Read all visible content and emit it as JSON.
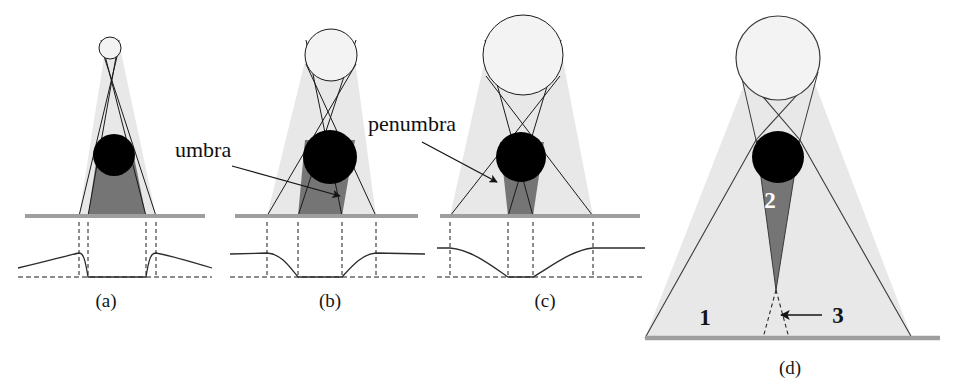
{
  "figure": {
    "background_color": "#ffffff"
  },
  "palette": {
    "umbra_fill": "#7a7a7a",
    "penumbra_fill": "#e6e6e6",
    "occluder_fill": "#000000",
    "source_fill": "#f2f2f2",
    "ground_color": "#9e9e9e",
    "outline_color": "#1a1a1a",
    "curve_color": "#2b2b2b",
    "dash_color": "#1a1a1a",
    "text_color": "#101010",
    "number_light_color": "#ffffff"
  },
  "callouts": [
    {
      "id": "umbra",
      "label": "umbra",
      "x": 175,
      "y": 157,
      "arrow_from": [
        232,
        166
      ],
      "arrow_to": [
        340,
        196
      ]
    },
    {
      "id": "penumbra",
      "label": "penumbra",
      "x": 368,
      "y": 131,
      "arrow_from": [
        422,
        142
      ],
      "arrow_to": [
        497,
        182
      ]
    }
  ],
  "panels": [
    {
      "id": "a",
      "label": "(a)",
      "label_x": 106,
      "label_y": 307,
      "source_size": "point-like (small)",
      "source": {
        "cx": 110,
        "cy": 48,
        "r": 11
      },
      "occluder": {
        "cx": 114,
        "cy": 155,
        "r": 21
      },
      "ground": {
        "x1": 25,
        "x2": 205,
        "y": 216
      },
      "umbra_band": {
        "left": 88,
        "right": 146
      },
      "penumbra_band": {
        "left": 79,
        "right": 156
      },
      "profile": {
        "baseline_y": 277,
        "plateau_y": 253,
        "outer_left": 18,
        "outer_right": 212,
        "shadow_left": 88,
        "shadow_right": 146,
        "penumbra_left": 79,
        "penumbra_right": 156,
        "description": "hard shadow: near-vertical transitions, flat dark core"
      }
    },
    {
      "id": "b",
      "label": "(b)",
      "label_x": 330,
      "label_y": 307,
      "source_size": "medium",
      "source": {
        "cx": 331,
        "cy": 55,
        "r": 26
      },
      "occluder": {
        "cx": 330,
        "cy": 157,
        "r": 27
      },
      "ground": {
        "x1": 235,
        "x2": 418,
        "y": 216
      },
      "umbra_band": {
        "left": 298,
        "right": 342
      },
      "penumbra_band": {
        "left": 267,
        "right": 376
      },
      "profile": {
        "baseline_y": 277,
        "plateau_y": 253,
        "outer_left": 230,
        "outer_right": 425,
        "shadow_left": 298,
        "shadow_right": 342,
        "penumbra_left": 267,
        "penumbra_right": 376,
        "description": "soft shadow: gradual S-curve transitions, flat dark core"
      }
    },
    {
      "id": "c",
      "label": "(c)",
      "label_x": 545,
      "label_y": 307,
      "source_size": "large",
      "source": {
        "cx": 523,
        "cy": 55,
        "r": 40
      },
      "occluder": {
        "cx": 521,
        "cy": 157,
        "r": 25
      },
      "ground": {
        "x1": 440,
        "x2": 640,
        "y": 216
      },
      "umbra_band": {
        "left": 508,
        "right": 533
      },
      "penumbra_band": {
        "left": 450,
        "right": 593
      },
      "profile": {
        "baseline_y": 277,
        "plateau_y": 248,
        "outer_left": 437,
        "outer_right": 645,
        "shadow_left": 508,
        "shadow_right": 533,
        "penumbra_left": 450,
        "penumbra_right": 593,
        "description": "very soft shadow: wide smooth basin, narrow dark core"
      }
    },
    {
      "id": "d",
      "label": "(d)",
      "label_x": 770,
      "label_y": 374,
      "source_size": "large (detail view)",
      "source": {
        "cx": 778,
        "cy": 58,
        "r": 42
      },
      "occluder": {
        "cx": 778,
        "cy": 157,
        "r": 26
      },
      "ground": {
        "x1": 645,
        "x2": 940,
        "y": 338
      },
      "umbra_apex": {
        "x": 776,
        "y": 290
      },
      "region_numbers": [
        {
          "label": "1",
          "x": 705,
          "y": 325,
          "style": "dark",
          "meaning": "penumbra region"
        },
        {
          "label": "2",
          "x": 770,
          "y": 208,
          "style": "light",
          "meaning": "umbra region"
        },
        {
          "label": "3",
          "x": 830,
          "y": 320,
          "style": "dark",
          "meaning": "antumbra / umbra apex",
          "arrow_from": [
            820,
            315
          ],
          "arrow_to": [
            781,
            315
          ]
        }
      ]
    }
  ]
}
